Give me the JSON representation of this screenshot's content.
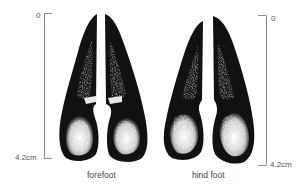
{
  "figure": {
    "panels": [
      {
        "id": "forefoot",
        "caption": "forefoot",
        "scale": {
          "top_label": "0",
          "bottom_label": "4.2cm",
          "side": "left"
        }
      },
      {
        "id": "hind-foot",
        "caption": "hind foot",
        "scale": {
          "top_label": "0",
          "bottom_label": "4.2cm",
          "side": "right"
        }
      }
    ]
  },
  "colors": {
    "ink": "#111111",
    "scale_line": "#8a8a8a",
    "text": "#444444",
    "background": "#ffffff"
  }
}
